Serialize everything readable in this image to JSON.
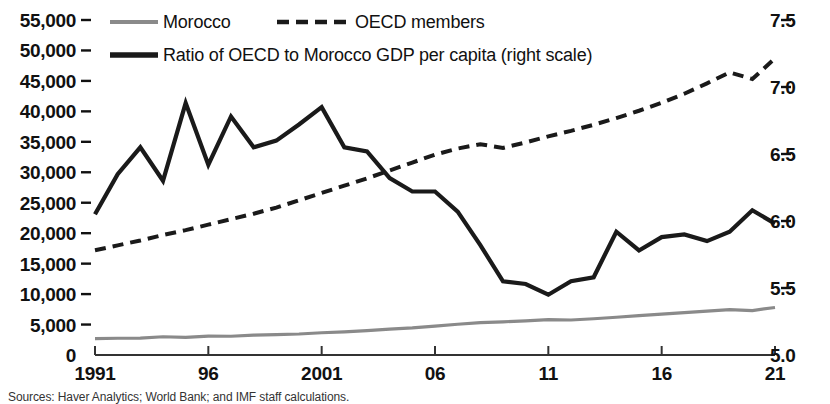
{
  "chart_data": {
    "type": "line",
    "title": "",
    "subtitle": "",
    "xlabel": "",
    "ylabel_left": "",
    "ylabel_right": "",
    "grid": false,
    "legend_position": "top-left",
    "x": [
      1991,
      1992,
      1993,
      1994,
      1995,
      1996,
      1997,
      1998,
      1999,
      2000,
      2001,
      2002,
      2003,
      2004,
      2005,
      2006,
      2007,
      2008,
      2009,
      2010,
      2011,
      2012,
      2013,
      2014,
      2015,
      2016,
      2017,
      2018,
      2019,
      2020,
      2021
    ],
    "x_tick_labels": [
      "1991",
      "96",
      "2001",
      "06",
      "11",
      "16",
      "21"
    ],
    "x_tick_values": [
      1991,
      1996,
      2001,
      2006,
      2011,
      2016,
      2021
    ],
    "xlim": [
      1991,
      2021
    ],
    "ylim_left": [
      0,
      55000
    ],
    "y_ticks_left": [
      0,
      5000,
      10000,
      15000,
      20000,
      25000,
      30000,
      35000,
      40000,
      45000,
      50000,
      55000
    ],
    "y_tick_labels_left": [
      "0",
      "5,000",
      "10,000",
      "15,000",
      "20,000",
      "25,000",
      "30,000",
      "35,000",
      "40,000",
      "45,000",
      "50,000",
      "55,000"
    ],
    "ylim_right": [
      5.0,
      7.5
    ],
    "y_ticks_right": [
      5.0,
      5.5,
      6.0,
      6.5,
      7.0,
      7.5
    ],
    "y_tick_labels_right": [
      "5.0",
      "5.5",
      "6.0",
      "6.5",
      "7.0",
      "7.5"
    ],
    "series": [
      {
        "name": "Morocco",
        "label": "Morocco",
        "axis": "left",
        "style": "solid",
        "color": "#8a8a8a",
        "width": 3.2,
        "values": [
          2700,
          2750,
          2780,
          3000,
          2900,
          3100,
          3080,
          3250,
          3350,
          3450,
          3650,
          3800,
          4000,
          4250,
          4450,
          4750,
          5050,
          5300,
          5450,
          5600,
          5800,
          5750,
          5950,
          6200,
          6450,
          6700,
          6950,
          7200,
          7450,
          7300,
          7800
        ]
      },
      {
        "name": "OECD members",
        "label": "OECD members",
        "axis": "left",
        "style": "dashed",
        "color": "#1a1a1a",
        "width": 4.0,
        "values": [
          17200,
          18000,
          18800,
          19700,
          20500,
          21400,
          22300,
          23200,
          24200,
          25400,
          26600,
          27800,
          29000,
          30300,
          31600,
          32900,
          33900,
          34600,
          34000,
          34900,
          35900,
          36800,
          37800,
          38900,
          40100,
          41400,
          42900,
          44600,
          46400,
          45300,
          48700
        ]
      },
      {
        "name": "Ratio of OECD to Morocco GDP per capita (right scale)",
        "label": "Ratio of OECD to Morocco GDP per capita (right scale)",
        "axis": "right",
        "style": "solid",
        "color": "#1a1a1a",
        "width": 4.2,
        "values": [
          6.05,
          6.35,
          6.55,
          6.3,
          6.88,
          6.42,
          6.78,
          6.55,
          6.6,
          6.72,
          6.85,
          6.55,
          6.52,
          6.32,
          6.22,
          6.22,
          6.07,
          5.82,
          5.55,
          5.53,
          5.45,
          5.55,
          5.58,
          5.92,
          5.78,
          5.88,
          5.9,
          5.85,
          5.92,
          6.08,
          5.98
        ]
      }
    ],
    "legend": [
      {
        "label": "Morocco",
        "style": "solid",
        "color": "#8a8a8a"
      },
      {
        "label": "OECD members",
        "style": "dashed",
        "color": "#1a1a1a"
      },
      {
        "label": "Ratio of OECD to Morocco GDP per capita (right scale)",
        "style": "solid-thick",
        "color": "#1a1a1a"
      }
    ],
    "source_note": "Sources: Haver Analytics; World Bank; and IMF staff calculations."
  }
}
